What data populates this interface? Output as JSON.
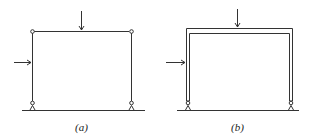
{
  "figures": [
    {
      "id": "a",
      "caption": "(a)",
      "description": "Pin-jointed frame with roller supports, horizontal and vertical point loads"
    },
    {
      "id": "b",
      "caption": "(b)",
      "description": "Rigid-jointed frame with roller supports, horizontal and vertical point loads"
    }
  ],
  "colors": {
    "line": "#333333",
    "background": "#ffffff"
  }
}
